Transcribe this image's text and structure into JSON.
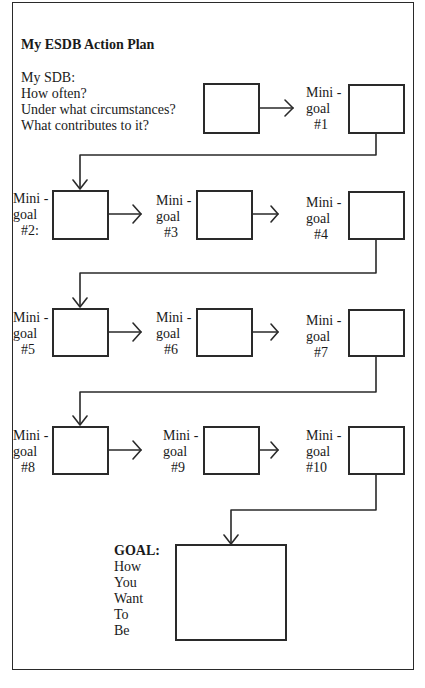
{
  "title": "My ESDB Action Plan",
  "sdb_prompt": {
    "lines": [
      "My SDB:",
      "How often?",
      "Under what circumstances?",
      "What contributes to it?"
    ]
  },
  "mini_goals": [
    {
      "mini": "Mini",
      "dash": "-",
      "goal": "goal",
      "num": "#1"
    },
    {
      "mini": "Mini",
      "dash": "-",
      "goal": "goal",
      "num": "#2:"
    },
    {
      "mini": "Mini",
      "dash": "-",
      "goal": "goal",
      "num": "#3"
    },
    {
      "mini": "Mini",
      "dash": "-",
      "goal": "goal",
      "num": "#4"
    },
    {
      "mini": "Mini",
      "dash": "-",
      "goal": "goal",
      "num": "#5"
    },
    {
      "mini": "Mini",
      "dash": "-",
      "goal": "goal",
      "num": "#6"
    },
    {
      "mini": "Mini",
      "dash": "-",
      "goal": "goal",
      "num": "#7"
    },
    {
      "mini": "Mini",
      "dash": "-",
      "goal": "goal",
      "num": "#8"
    },
    {
      "mini": "Mini",
      "dash": "-",
      "goal": "goal",
      "num": "#9"
    },
    {
      "mini": "Mini",
      "dash": "-",
      "goal": "goal",
      "num": "#10"
    }
  ],
  "final_goal": {
    "heading": "GOAL:",
    "lines": [
      "How",
      "You",
      "Want",
      "To",
      "Be"
    ]
  }
}
